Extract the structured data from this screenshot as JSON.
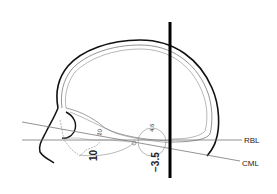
{
  "diagram": {
    "lines": [
      {
        "id": "RBL",
        "label": "RBL"
      },
      {
        "id": "CML",
        "label": "CML"
      }
    ],
    "annotations": {
      "angle_small_10": "10",
      "angle_bold_10": "10",
      "angle_4_6": "4.6",
      "angle_neg_3_5": "−3.5"
    },
    "colors": {
      "outline": "#111111",
      "thin_line": "#777777",
      "background": "#ffffff"
    }
  }
}
